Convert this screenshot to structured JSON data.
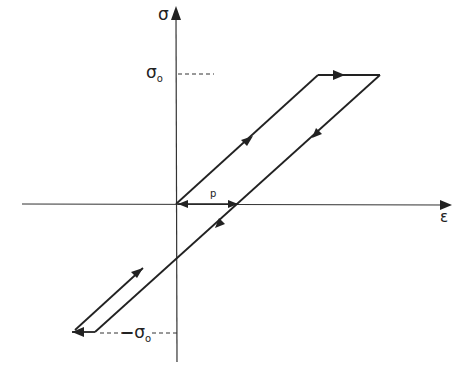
{
  "diagram": {
    "title": "",
    "type": "stress-strain hysteresis loop",
    "axes": {
      "y_label": "σ",
      "x_label": "ε"
    },
    "labels": {
      "sigma0_top": "σ",
      "sigma0_top_sub": "o",
      "sigma0_bottom_minus": "−",
      "sigma0_bottom": "σ",
      "sigma0_bottom_sub": "o",
      "p": "p"
    },
    "colors": {
      "line": "#222222",
      "background": "#ffffff"
    }
  }
}
